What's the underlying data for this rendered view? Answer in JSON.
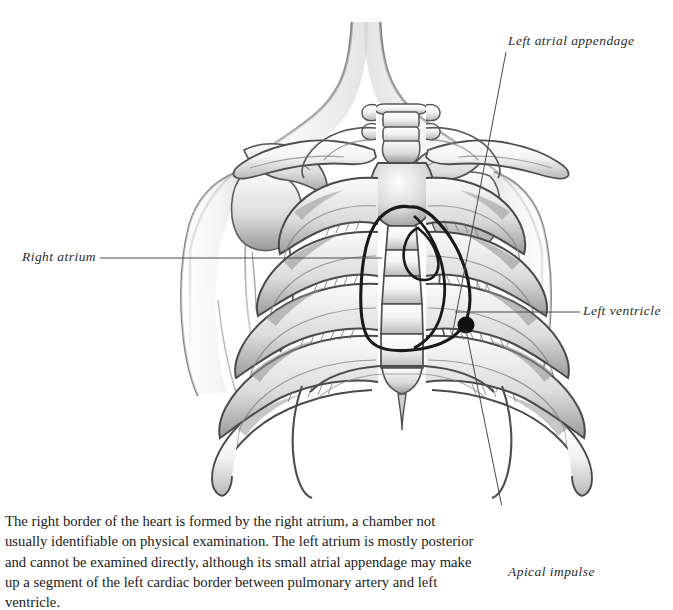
{
  "figure": {
    "kind": "anatomical-illustration",
    "style": "pencil-graphite shaded line drawing",
    "background_color": "#ffffff",
    "ink_color": "#2b2b2b",
    "heart_outline_color": "#1a1a1a",
    "apical_impulse_marker_color": "#111111"
  },
  "labels": {
    "left_atrial_appendage": "Left atrial appendage",
    "right_atrium": "Right atrium",
    "left_ventricle": "Left ventricle",
    "apical_impulse": "Apical impulse"
  },
  "caption": {
    "text": "The right border of the heart is formed by the right atrium, a chamber not usually identifiable on physical examination. The left atrium is mostly posterior and cannot be examined directly, although its small atrial appendage may make up a segment of the left cardiac border between pulmonary artery and left ventricle."
  }
}
